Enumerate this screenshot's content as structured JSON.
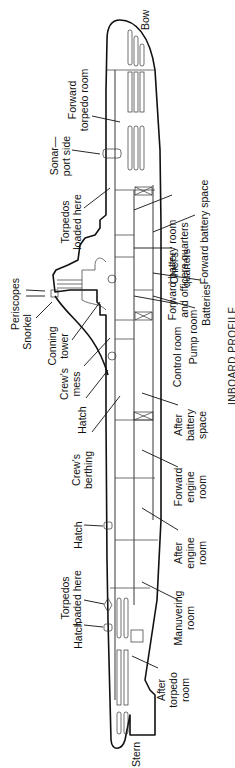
{
  "diagram": {
    "title": "INBOARD PROFILE",
    "ends": {
      "bow": "Bow",
      "stern": "Stern"
    },
    "labels": [
      {
        "id": "forward-torpedo-room",
        "lines": [
          "Forward",
          "torpedo room"
        ],
        "x": 76,
        "y": 100
      },
      {
        "id": "sonar-port-side",
        "lines": [
          "Sonar—",
          "port side"
        ],
        "x": 58,
        "y": 156
      },
      {
        "id": "torpedos-loaded-here-fwd",
        "lines": [
          "Torpedos",
          "loaded here"
        ],
        "x": 69,
        "y": 222
      },
      {
        "id": "periscopes",
        "lines": [
          "Periscopes"
        ],
        "x": 19,
        "y": 304
      },
      {
        "id": "snorkel",
        "lines": [
          "Snorkel"
        ],
        "x": 31,
        "y": 332
      },
      {
        "id": "conning-tower",
        "lines": [
          "Conning",
          "tower"
        ],
        "x": 56,
        "y": 346
      },
      {
        "id": "crews-mess",
        "lines": [
          "Crew's",
          "mess"
        ],
        "x": 68,
        "y": 384
      },
      {
        "id": "hatch-1",
        "lines": [
          "Hatch"
        ],
        "x": 86,
        "y": 420
      },
      {
        "id": "crews-berthing",
        "lines": [
          "Crew's",
          "berthing"
        ],
        "x": 80,
        "y": 470
      },
      {
        "id": "hatch-2",
        "lines": [
          "Hatch"
        ],
        "x": 82,
        "y": 535
      },
      {
        "id": "torpedos-loaded-here-aft",
        "lines": [
          "Torpedos",
          "loaded here"
        ],
        "x": 69,
        "y": 598
      },
      {
        "id": "hatch-3",
        "lines": [
          "Hatch"
        ],
        "x": 82,
        "y": 635
      },
      {
        "id": "forward-battery-room",
        "lines": [
          "Forward battery room",
          "and officers quarters"
        ],
        "x": 176,
        "y": 270
      },
      {
        "id": "forward-battery-space",
        "lines": [
          "Forward  battery space"
        ],
        "x": 208,
        "y": 232
      },
      {
        "id": "chiefs-quarters",
        "lines": [
          "Chief's",
          "quarters"
        ],
        "x": 178,
        "y": 268
      },
      {
        "id": "batteries",
        "lines": [
          "Batteries"
        ],
        "x": 210,
        "y": 305
      },
      {
        "id": "control-room",
        "lines": [
          "Control room"
        ],
        "x": 181,
        "y": 357
      },
      {
        "id": "pump-room",
        "lines": [
          "Pump room"
        ],
        "x": 197,
        "y": 337
      },
      {
        "id": "after-battery-space",
        "lines": [
          "After",
          "battery",
          "space"
        ],
        "x": 182,
        "y": 425
      },
      {
        "id": "forward-engine-room",
        "lines": [
          "Forward",
          "engine",
          "room"
        ],
        "x": 182,
        "y": 487
      },
      {
        "id": "after-engine-room",
        "lines": [
          "After",
          "engine",
          "room"
        ],
        "x": 182,
        "y": 553
      },
      {
        "id": "manuvering-room",
        "lines": [
          "Manuvering",
          "room"
        ],
        "x": 182,
        "y": 618
      },
      {
        "id": "after-torpedo-room",
        "lines": [
          "After",
          "torpedo",
          "room"
        ],
        "x": 165,
        "y": 690
      }
    ]
  }
}
